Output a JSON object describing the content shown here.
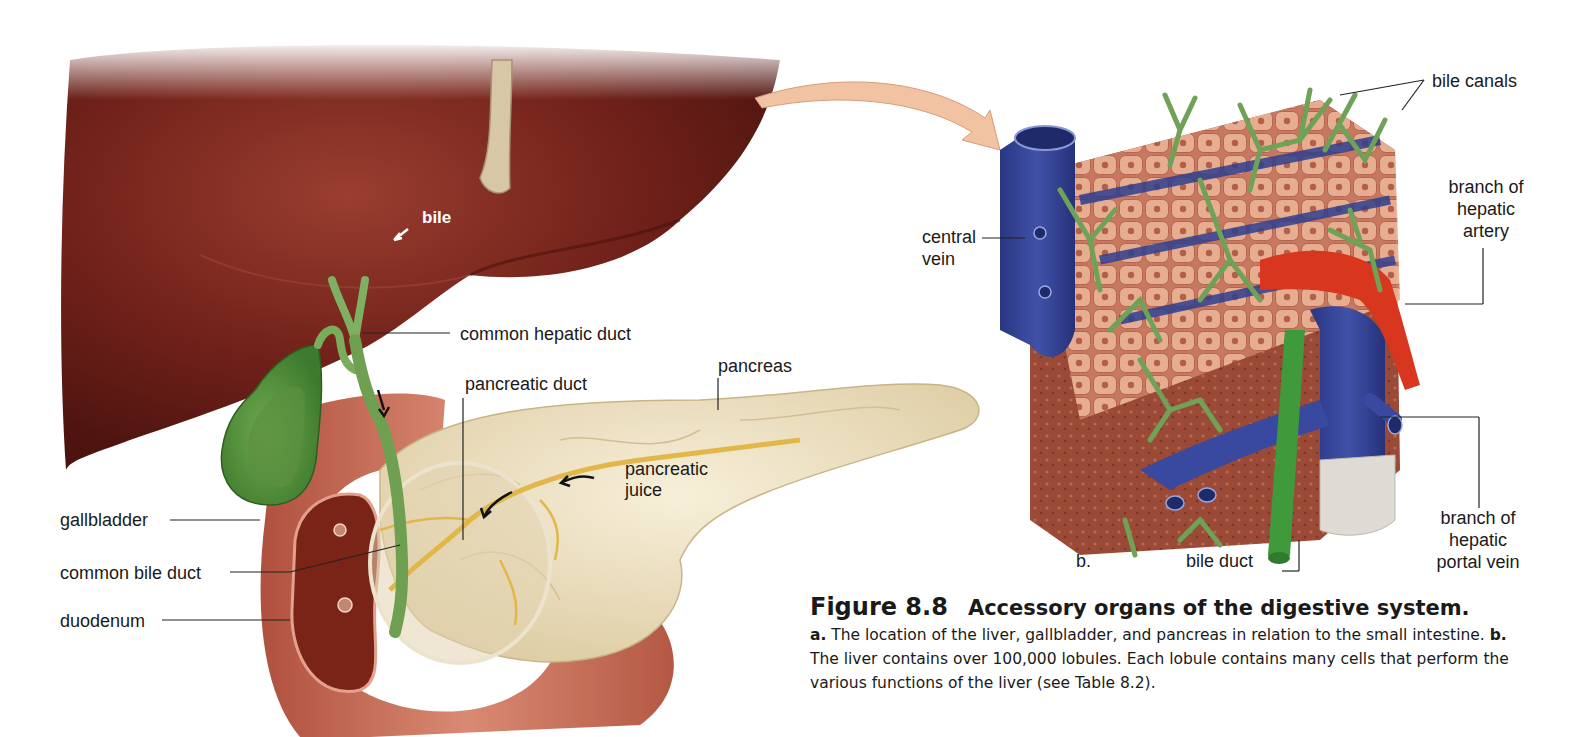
{
  "figure": {
    "number": "Figure 8.8",
    "title": "Accessory organs of the digestive system.",
    "caption": {
      "part_a_marker": "a.",
      "part_a_text": " The location of the liver, gallbladder, and pancreas in relation to the small intestine. ",
      "part_b_marker": "b.",
      "part_b_text": " The liver contains over 100,000 lobules. Each lobule contains many cells that perform the various functions of the liver (see Table 8.2)."
    }
  },
  "panel_a": {
    "labels": {
      "bile": "bile",
      "common_hepatic_duct": "common hepatic duct",
      "pancreas": "pancreas",
      "pancreatic_duct": "pancreatic duct",
      "pancreatic_juice_1": "pancreatic",
      "pancreatic_juice_2": "juice",
      "gallbladder": "gallbladder",
      "common_bile_duct": "common bile duct",
      "duodenum": "duodenum"
    }
  },
  "panel_b": {
    "marker": "b.",
    "labels": {
      "bile_canals": "bile canals",
      "hepatic_artery_1": "branch of",
      "hepatic_artery_2": "hepatic",
      "hepatic_artery_3": "artery",
      "central_vein_1": "central",
      "central_vein_2": "vein",
      "bile_duct": "bile duct",
      "portal_vein_1": "branch of",
      "portal_vein_2": "hepatic",
      "portal_vein_3": "portal vein"
    }
  },
  "colors": {
    "liver": "#6e1e18",
    "gallbladder": "#5f9a45",
    "pancreas": "#efe3c4",
    "duodenum": "#c66a55",
    "vein": "#2e3f8f",
    "artery": "#d8361e",
    "bile_canal": "#6fa257",
    "hepatocyte": "#e1a184",
    "zoom_arrow": "#f1c3a3"
  }
}
